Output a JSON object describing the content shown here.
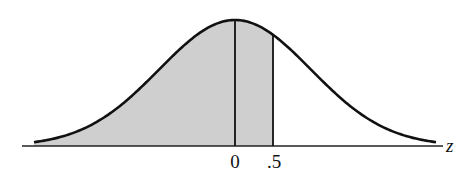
{
  "figure": {
    "type": "standard normal distribution curve",
    "axis_label": "z",
    "tick_labels": [
      "0",
      ".5"
    ],
    "shaded_region": {
      "from": "-inf",
      "to": 0.5
    },
    "colors": {
      "curve": "#111111",
      "fill": "#cfcfcf",
      "axis": "#222222"
    }
  },
  "chart_data": {
    "type": "area",
    "title": "",
    "xlabel": "z",
    "ylabel": "",
    "distribution": "standard normal",
    "shaded_from": null,
    "shaded_to": 0.5,
    "vertical_lines": [
      0,
      0.5
    ],
    "tick_labels": [
      "0",
      ".5"
    ],
    "grid": false
  }
}
